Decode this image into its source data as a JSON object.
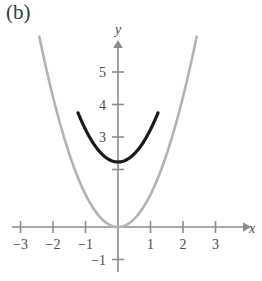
{
  "panel": {
    "label": "(b)"
  },
  "chart_data": {
    "type": "line",
    "title": "",
    "subtitle": "",
    "xlabel": "x",
    "ylabel": "y",
    "xlim": [
      -3.6,
      3.9
    ],
    "ylim": [
      -1.5,
      6.0
    ],
    "grid": false,
    "legend": "none",
    "axes_style": "arrowed-cartesian",
    "x_ticks": [
      -3,
      -2,
      -1,
      1,
      2,
      3
    ],
    "x_tick_labels": [
      "−3",
      "−2",
      "−1",
      "1",
      "2",
      "3"
    ],
    "y_ticks": [
      -1,
      2,
      3,
      4,
      5
    ],
    "y_tick_labels": [
      "−1",
      "",
      "3",
      "4",
      "5"
    ],
    "series": [
      {
        "name": "y = x^2",
        "color": "#b3b3b3",
        "width": 2.6,
        "x_domain": [
          -2.42,
          2.42
        ],
        "vertex": [
          0,
          0
        ],
        "a": 1,
        "k": 0,
        "points": [
          [
            -2.42,
            5.86
          ],
          [
            -2.2,
            4.84
          ],
          [
            -2.0,
            4.0
          ],
          [
            -1.8,
            3.24
          ],
          [
            -1.6,
            2.56
          ],
          [
            -1.4,
            1.96
          ],
          [
            -1.2,
            1.44
          ],
          [
            -1.0,
            1.0
          ],
          [
            -0.8,
            0.64
          ],
          [
            -0.6,
            0.36
          ],
          [
            -0.4,
            0.16
          ],
          [
            -0.2,
            0.04
          ],
          [
            0.0,
            0.0
          ],
          [
            0.2,
            0.04
          ],
          [
            0.4,
            0.16
          ],
          [
            0.6,
            0.36
          ],
          [
            0.8,
            0.64
          ],
          [
            1.0,
            1.0
          ],
          [
            1.2,
            1.44
          ],
          [
            1.4,
            1.96
          ],
          [
            1.6,
            2.56
          ],
          [
            1.8,
            3.24
          ],
          [
            2.0,
            4.0
          ],
          [
            2.2,
            4.84
          ],
          [
            2.42,
            5.86
          ]
        ]
      },
      {
        "name": "y = x^2 + 2",
        "color": "#1a1a1a",
        "width": 3.2,
        "x_domain": [
          -1.23,
          1.23
        ],
        "vertex": [
          0,
          2
        ],
        "a": 1,
        "k": 2,
        "points": [
          [
            -1.23,
            3.51
          ],
          [
            -1.1,
            3.21
          ],
          [
            -1.0,
            3.0
          ],
          [
            -0.9,
            2.81
          ],
          [
            -0.8,
            2.64
          ],
          [
            -0.7,
            2.49
          ],
          [
            -0.6,
            2.36
          ],
          [
            -0.5,
            2.25
          ],
          [
            -0.4,
            2.16
          ],
          [
            -0.3,
            2.09
          ],
          [
            -0.2,
            2.04
          ],
          [
            -0.1,
            2.01
          ],
          [
            0.0,
            2.0
          ],
          [
            0.1,
            2.01
          ],
          [
            0.2,
            2.04
          ],
          [
            0.3,
            2.09
          ],
          [
            0.4,
            2.16
          ],
          [
            0.5,
            2.25
          ],
          [
            0.6,
            2.36
          ],
          [
            0.7,
            2.49
          ],
          [
            0.8,
            2.64
          ],
          [
            0.9,
            2.81
          ],
          [
            1.0,
            3.0
          ],
          [
            1.1,
            3.21
          ],
          [
            1.23,
            3.51
          ]
        ]
      }
    ],
    "colors": {
      "axis": "#8c8c8c",
      "text": "#4a4a4a",
      "curve_light": "#b3b3b3",
      "curve_dark": "#1a1a1a",
      "background": "#ffffff"
    }
  }
}
